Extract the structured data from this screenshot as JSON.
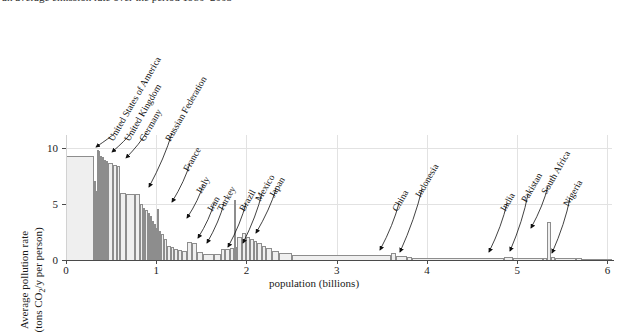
{
  "caption": "an average emission rate over the period 1980–2005",
  "axes": {
    "xlabel": "population (billions)",
    "ylabel_line1": "Average pollution rate",
    "ylabel_line2": "(tons CO₂/y per person)",
    "xticks": [
      "0",
      "1",
      "2",
      "3",
      "4",
      "5",
      "6"
    ],
    "xtick_values": [
      0,
      1,
      2,
      3,
      4,
      5,
      6
    ],
    "yticks": [
      "0",
      "5",
      "10"
    ],
    "ytick_values": [
      0,
      5,
      10
    ],
    "xlim": [
      0,
      6.05
    ],
    "ylim": [
      0,
      11.2
    ]
  },
  "colors": {
    "bar_fill": "#efefef",
    "bar_edge": "#8d8d8d",
    "axis": "#4a4a4a",
    "grid": "#e2e2e2",
    "text": "#1a1a1a"
  },
  "annotations": [
    {
      "label": "United States of America",
      "lx": 115,
      "ly": 133,
      "ax": 96,
      "ay": 147
    },
    {
      "label": "United Kingdom",
      "lx": 131,
      "ly": 133,
      "ax": 112,
      "ay": 152
    },
    {
      "label": "Germany",
      "lx": 146,
      "ly": 133,
      "ax": 126,
      "ay": 158
    },
    {
      "label": "Russian Federation",
      "lx": 172,
      "ly": 133,
      "ax": 149,
      "ay": 187
    },
    {
      "label": "France",
      "lx": 190,
      "ly": 163,
      "ax": 172,
      "ay": 202
    },
    {
      "label": "Italy",
      "lx": 203,
      "ly": 185,
      "ax": 187,
      "ay": 218
    },
    {
      "label": "Iran",
      "lx": 214,
      "ly": 203,
      "ax": 198,
      "ay": 238
    },
    {
      "label": "Turkey",
      "lx": 224,
      "ly": 203,
      "ax": 207,
      "ay": 243
    },
    {
      "label": "Brazil",
      "lx": 246,
      "ly": 203,
      "ax": 228,
      "ay": 247
    },
    {
      "label": "Mexico",
      "lx": 262,
      "ly": 193,
      "ax": 243,
      "ay": 243
    },
    {
      "label": "Japan",
      "lx": 276,
      "ly": 189,
      "ax": 256,
      "ay": 233
    },
    {
      "label": "China",
      "lx": 399,
      "ly": 203,
      "ax": 380,
      "ay": 250
    },
    {
      "label": "Indonesia",
      "lx": 422,
      "ly": 189,
      "ax": 400,
      "ay": 252
    },
    {
      "label": "India",
      "lx": 507,
      "ly": 203,
      "ax": 489,
      "ay": 252
    },
    {
      "label": "Pakistan",
      "lx": 528,
      "ly": 194,
      "ax": 510,
      "ay": 251
    },
    {
      "label": "South Africa",
      "lx": 548,
      "ly": 186,
      "ax": 531,
      "ay": 228
    },
    {
      "label": "Nigeria",
      "lx": 570,
      "ly": 198,
      "ax": 552,
      "ay": 253
    }
  ],
  "chart_data": {
    "type": "bar",
    "title": "",
    "subtitle": "",
    "xlabel": "population (billions)",
    "ylabel": "Average pollution rate (tons CO2/y per person)",
    "xlim": [
      0,
      6.05
    ],
    "ylim": [
      0,
      11.2
    ],
    "grid": true,
    "legend": "none",
    "note": "Values are read off the axes; bar widths are population in billions, heights are tons CO2 per person per year.",
    "bars": [
      {
        "x0": 0.0,
        "x1": 0.31,
        "height": 9.3,
        "label": ""
      },
      {
        "x0": 0.31,
        "x1": 0.33,
        "height": 7.1,
        "label": ""
      },
      {
        "x0": 0.33,
        "x1": 0.34,
        "height": 6.2,
        "label": ""
      },
      {
        "x0": 0.34,
        "x1": 0.36,
        "height": 9.9,
        "label": "United States of America"
      },
      {
        "x0": 0.36,
        "x1": 0.375,
        "height": 9.75,
        "label": ""
      },
      {
        "x0": 0.375,
        "x1": 0.395,
        "height": 9.3,
        "label": "United Kingdom"
      },
      {
        "x0": 0.395,
        "x1": 0.42,
        "height": 9.2,
        "label": ""
      },
      {
        "x0": 0.42,
        "x1": 0.44,
        "height": 9.0,
        "label": "Germany"
      },
      {
        "x0": 0.44,
        "x1": 0.47,
        "height": 8.9,
        "label": ""
      },
      {
        "x0": 0.47,
        "x1": 0.52,
        "height": 8.7,
        "label": ""
      },
      {
        "x0": 0.52,
        "x1": 0.56,
        "height": 8.5,
        "label": ""
      },
      {
        "x0": 0.56,
        "x1": 0.6,
        "height": 8.4,
        "label": ""
      },
      {
        "x0": 0.6,
        "x1": 0.66,
        "height": 6.0,
        "label": ""
      },
      {
        "x0": 0.66,
        "x1": 0.76,
        "height": 5.95,
        "label": ""
      },
      {
        "x0": 0.76,
        "x1": 0.82,
        "height": 5.9,
        "label": "Russian Federation"
      },
      {
        "x0": 0.82,
        "x1": 0.855,
        "height": 5.0,
        "label": ""
      },
      {
        "x0": 0.855,
        "x1": 0.88,
        "height": 4.7,
        "label": ""
      },
      {
        "x0": 0.88,
        "x1": 0.905,
        "height": 4.5,
        "label": "France"
      },
      {
        "x0": 0.905,
        "x1": 0.93,
        "height": 4.2,
        "label": ""
      },
      {
        "x0": 0.93,
        "x1": 0.95,
        "height": 3.95,
        "label": ""
      },
      {
        "x0": 0.95,
        "x1": 0.975,
        "height": 3.5,
        "label": ""
      },
      {
        "x0": 0.975,
        "x1": 0.995,
        "height": 3.2,
        "label": ""
      },
      {
        "x0": 0.995,
        "x1": 1.01,
        "height": 2.9,
        "label": ""
      },
      {
        "x0": 1.01,
        "x1": 1.03,
        "height": 4.6,
        "label": "Italy"
      },
      {
        "x0": 1.03,
        "x1": 1.055,
        "height": 2.6,
        "label": ""
      },
      {
        "x0": 1.055,
        "x1": 1.085,
        "height": 2.3,
        "label": ""
      },
      {
        "x0": 1.085,
        "x1": 1.12,
        "height": 1.9,
        "label": ""
      },
      {
        "x0": 1.12,
        "x1": 1.16,
        "height": 1.3,
        "label": ""
      },
      {
        "x0": 1.16,
        "x1": 1.2,
        "height": 1.15,
        "label": ""
      },
      {
        "x0": 1.2,
        "x1": 1.24,
        "height": 1.0,
        "label": "Iran"
      },
      {
        "x0": 1.24,
        "x1": 1.29,
        "height": 0.9,
        "label": "Turkey"
      },
      {
        "x0": 1.29,
        "x1": 1.34,
        "height": 0.8,
        "label": ""
      },
      {
        "x0": 1.34,
        "x1": 1.4,
        "height": 1.6,
        "label": ""
      },
      {
        "x0": 1.4,
        "x1": 1.45,
        "height": 1.5,
        "label": ""
      },
      {
        "x0": 1.45,
        "x1": 1.52,
        "height": 0.7,
        "label": ""
      },
      {
        "x0": 1.52,
        "x1": 1.64,
        "height": 0.55,
        "label": ""
      },
      {
        "x0": 1.64,
        "x1": 1.72,
        "height": 0.5,
        "label": ""
      },
      {
        "x0": 1.72,
        "x1": 1.76,
        "height": 0.95,
        "label": "Brazil"
      },
      {
        "x0": 1.76,
        "x1": 1.82,
        "height": 1.0,
        "label": ""
      },
      {
        "x0": 1.82,
        "x1": 1.86,
        "height": 1.1,
        "label": ""
      },
      {
        "x0": 1.86,
        "x1": 1.88,
        "height": 5.4,
        "label": ""
      },
      {
        "x0": 1.88,
        "x1": 1.9,
        "height": 1.2,
        "label": "Mexico"
      },
      {
        "x0": 1.9,
        "x1": 1.95,
        "height": 2.05,
        "label": ""
      },
      {
        "x0": 1.95,
        "x1": 2.0,
        "height": 2.4,
        "label": ""
      },
      {
        "x0": 2.0,
        "x1": 2.04,
        "height": 2.1,
        "label": "Japan"
      },
      {
        "x0": 2.04,
        "x1": 2.08,
        "height": 1.9,
        "label": ""
      },
      {
        "x0": 2.08,
        "x1": 2.12,
        "height": 1.7,
        "label": ""
      },
      {
        "x0": 2.12,
        "x1": 2.17,
        "height": 1.5,
        "label": ""
      },
      {
        "x0": 2.17,
        "x1": 2.22,
        "height": 1.3,
        "label": ""
      },
      {
        "x0": 2.22,
        "x1": 2.28,
        "height": 1.1,
        "label": ""
      },
      {
        "x0": 2.28,
        "x1": 2.36,
        "height": 0.85,
        "label": ""
      },
      {
        "x0": 2.36,
        "x1": 2.5,
        "height": 0.6,
        "label": ""
      },
      {
        "x0": 2.5,
        "x1": 3.6,
        "height": 0.42,
        "label": ""
      },
      {
        "x0": 3.6,
        "x1": 3.66,
        "height": 0.6,
        "label": "China"
      },
      {
        "x0": 3.66,
        "x1": 3.78,
        "height": 0.38,
        "label": ""
      },
      {
        "x0": 3.78,
        "x1": 3.83,
        "height": 0.3,
        "label": "Indonesia"
      },
      {
        "x0": 3.83,
        "x1": 4.85,
        "height": 0.22,
        "label": ""
      },
      {
        "x0": 4.85,
        "x1": 4.95,
        "height": 0.26,
        "label": "India"
      },
      {
        "x0": 4.95,
        "x1": 5.28,
        "height": 0.18,
        "label": ""
      },
      {
        "x0": 5.28,
        "x1": 5.33,
        "height": 0.22,
        "label": "Pakistan"
      },
      {
        "x0": 5.33,
        "x1": 5.375,
        "height": 3.4,
        "label": "South Africa"
      },
      {
        "x0": 5.375,
        "x1": 5.42,
        "height": 0.3,
        "label": ""
      },
      {
        "x0": 5.42,
        "x1": 5.65,
        "height": 0.14,
        "label": ""
      },
      {
        "x0": 5.65,
        "x1": 5.72,
        "height": 0.16,
        "label": "Nigeria"
      },
      {
        "x0": 5.72,
        "x1": 6.05,
        "height": 0.1,
        "label": ""
      }
    ]
  }
}
